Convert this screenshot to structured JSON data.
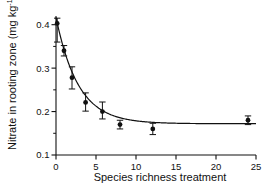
{
  "chart_data": {
    "type": "scatter",
    "title": "",
    "xlabel": "Species richness treatment",
    "ylabel": "Nitrate in rooting zone (mg kg",
    "ylabel_sup": "-1",
    "ylabel_tail": ")",
    "xlim": [
      0,
      25
    ],
    "ylim": [
      0.1,
      0.42
    ],
    "grid": false,
    "legend": null,
    "xticks": [
      0,
      5,
      10,
      15,
      20,
      25
    ],
    "xtick_labels": [
      "0",
      "5",
      "10",
      "15",
      "20",
      "25"
    ],
    "yticks": [
      0.1,
      0.2,
      0.3,
      0.4
    ],
    "ytick_labels": [
      "0.1",
      "0.2",
      "0.3",
      "0.4"
    ],
    "yminor": [
      0.15,
      0.25,
      0.35
    ],
    "x": [
      0.15,
      1.0,
      2.0,
      3.7,
      5.8,
      8.0,
      12.1,
      24.0
    ],
    "values": [
      0.403,
      0.34,
      0.278,
      0.221,
      0.2,
      0.17,
      0.16,
      0.18
    ],
    "yerr_upper": [
      0.415,
      0.352,
      0.303,
      0.243,
      0.222,
      0.18,
      0.173,
      0.19
    ],
    "yerr_lower": [
      0.36,
      0.328,
      0.252,
      0.201,
      0.183,
      0.16,
      0.147,
      0.17
    ],
    "fit_curve": {
      "description": "exponential decay to asymptote",
      "asymptote": 0.172,
      "amplitude": 0.245,
      "rate": 0.36
    },
    "marker": "filled-circle",
    "marker_color": "#111111",
    "line_color": "#111111"
  }
}
